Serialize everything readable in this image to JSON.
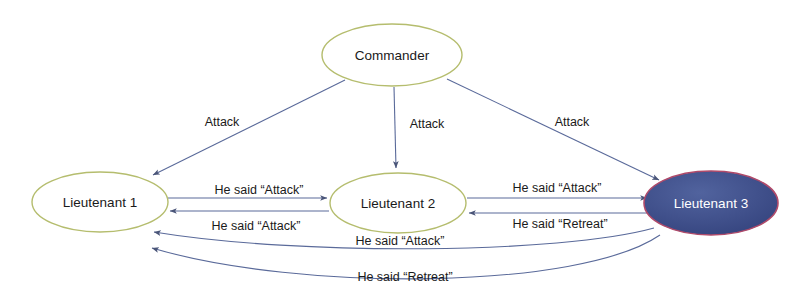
{
  "diagram": {
    "colors": {
      "background": "#ffffff",
      "node_stroke": "#b5bd6e",
      "node_fill": "#ffffff",
      "traitor_fill": "#3b4d8f",
      "traitor_stroke": "#b04a6a",
      "traitor_text": "#ffffff",
      "edge": "#5a6a9a",
      "edge_dark": "#4a5578",
      "text": "#1a1a1a"
    },
    "nodes": [
      {
        "id": "commander",
        "label": "Commander",
        "cx": 392,
        "cy": 55,
        "rx": 70,
        "ry": 31,
        "style": "open"
      },
      {
        "id": "lieutenant1",
        "label": "Lieutenant 1",
        "cx": 100,
        "cy": 202,
        "rx": 68,
        "ry": 30,
        "style": "open"
      },
      {
        "id": "lieutenant2",
        "label": "Lieutenant 2",
        "cx": 398,
        "cy": 203,
        "rx": 68,
        "ry": 30,
        "style": "open"
      },
      {
        "id": "lieutenant3",
        "label": "Lieutenant 3",
        "cx": 711,
        "cy": 203,
        "rx": 67,
        "ry": 32,
        "style": "filled"
      }
    ],
    "edges": [
      {
        "id": "cmd-to-l1",
        "from": "commander",
        "to": "lieutenant1",
        "label": "Attack",
        "label_x": 222,
        "label_y": 126
      },
      {
        "id": "cmd-to-l2",
        "from": "commander",
        "to": "lieutenant2",
        "label": "Attack",
        "label_x": 427,
        "label_y": 128
      },
      {
        "id": "cmd-to-l3",
        "from": "commander",
        "to": "lieutenant3",
        "label": "Attack",
        "label_x": 572,
        "label_y": 126
      },
      {
        "id": "l1-to-l2",
        "from": "lieutenant1",
        "to": "lieutenant2",
        "label": "He said “Attack”",
        "label_x": 259,
        "label_y": 194
      },
      {
        "id": "l2-to-l1",
        "from": "lieutenant2",
        "to": "lieutenant1",
        "label": "He said “Attack”",
        "label_x": 256,
        "label_y": 230
      },
      {
        "id": "l2-to-l3",
        "from": "lieutenant2",
        "to": "lieutenant3",
        "label": "He said “Attack”",
        "label_x": 557,
        "label_y": 192
      },
      {
        "id": "l3-to-l2",
        "from": "lieutenant3",
        "to": "lieutenant2",
        "label": "He said “Retreat”",
        "label_x": 560,
        "label_y": 228
      },
      {
        "id": "l3-to-l1-attack",
        "from": "lieutenant3",
        "to": "lieutenant1",
        "label": "He said “Attack”",
        "label_x": 400,
        "label_y": 245
      },
      {
        "id": "l3-to-l1-retreat",
        "from": "lieutenant3",
        "to": "lieutenant1",
        "label": "He said “Retreat”",
        "label_x": 405,
        "label_y": 281
      }
    ]
  }
}
